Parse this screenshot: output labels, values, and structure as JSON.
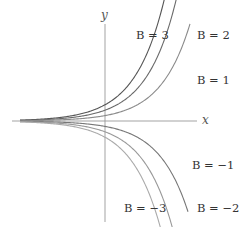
{
  "chart_data": {
    "type": "line",
    "title": "",
    "xlabel": "x",
    "ylabel": "y",
    "grid": false,
    "legend": "inline labels at curve ends",
    "function": "y = B e^x",
    "series": [
      {
        "name": "B = 3",
        "B": 3,
        "color": "#555555"
      },
      {
        "name": "B = 2",
        "B": 2,
        "color": "#6a6a6a"
      },
      {
        "name": "B = 1",
        "B": 1,
        "color": "#8a8a8a"
      },
      {
        "name": "B = -1",
        "B": -1,
        "color": "#777777"
      },
      {
        "name": "B = -2",
        "B": -2,
        "color": "#999999"
      },
      {
        "name": "B = -3",
        "B": -3,
        "color": "#aaaaaa"
      }
    ],
    "labels": {
      "x_axis": "x",
      "y_axis": "y",
      "b3": "B = 3",
      "b2": "B = 2",
      "b1": "B = 1",
      "bm1": "B = −1",
      "bm2": "B = −2",
      "bm3": "B = −3"
    }
  }
}
